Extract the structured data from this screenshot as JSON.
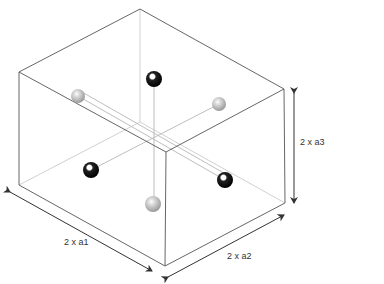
{
  "diagram": {
    "type": "crystal-unit-cell",
    "colors": {
      "edge": "#555555",
      "hidden_edge": "#bbbbbb",
      "bond": "#aaaaaa",
      "gray_atom": "#a8a8a8",
      "black_atom": "#111111",
      "arrow": "#333333"
    },
    "labels": {
      "a1": "2 x a1",
      "a2": "2 x a2",
      "a3": "2 x a3"
    },
    "atoms": [
      {
        "kind": "gray",
        "x": 78,
        "y": 96
      },
      {
        "kind": "black",
        "x": 154,
        "y": 79
      },
      {
        "kind": "gray",
        "x": 219,
        "y": 104
      },
      {
        "kind": "black",
        "x": 91,
        "y": 170
      },
      {
        "kind": "black",
        "x": 225,
        "y": 180
      },
      {
        "kind": "gray",
        "x": 153,
        "y": 204
      }
    ]
  }
}
